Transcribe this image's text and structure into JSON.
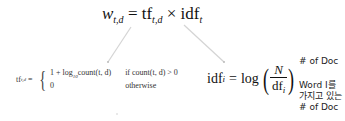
{
  "main_formula": {
    "lhs": "w",
    "lhs_sub": "t,d",
    "eq": "=",
    "tf": "tf",
    "tf_sub": "t,d",
    "times": "×",
    "idf": "idf",
    "idf_sub": "t"
  },
  "tf_formula": {
    "lhs": "tf",
    "lhs_sub": "t,d",
    "eq": "=",
    "case1_expr": "1 + log",
    "case1_log_base": "10",
    "case1_expr2": "count(t, d)",
    "case1_cond": "if  count(t, d) > 0",
    "case2_expr": "0",
    "case2_cond": "otherwise"
  },
  "idf_formula": {
    "lhs": "idf",
    "lhs_sub": "i",
    "eq": "=",
    "log": "log",
    "numerator": "N",
    "denominator": "df",
    "denominator_sub": "i"
  },
  "annotations": {
    "numerator_note": "# of Doc",
    "denominator_note_line1": "Word I를",
    "denominator_note_line2": "가지고 있는",
    "denominator_note_line3": "# of Doc"
  },
  "colors": {
    "connector": "#d0d0d0",
    "text": "#111111"
  }
}
